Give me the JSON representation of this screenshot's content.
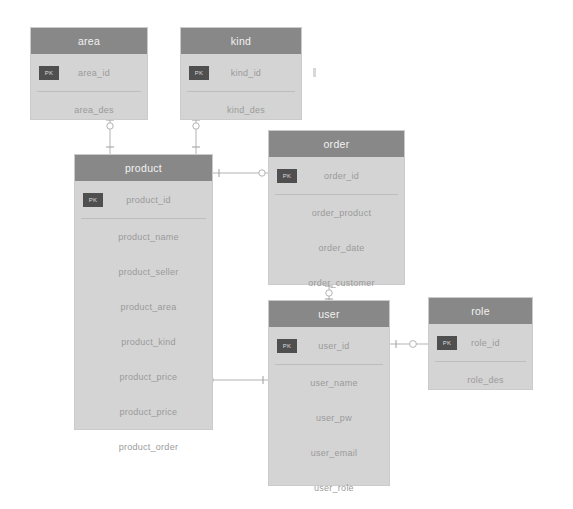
{
  "diagram": {
    "colors": {
      "background": "#ffffff",
      "entity_header": "#888888",
      "entity_body": "#d4d4d4",
      "pk_badge": "#4f4f4f",
      "attribute_text": "#9a9a9a",
      "edge": "#b3b3b3"
    },
    "pk_label": "PK"
  },
  "entities": [
    {
      "id": "area",
      "name": "area",
      "x": 30,
      "y": 27,
      "width": 118,
      "height": 93,
      "attributes": [
        {
          "name": "area_id",
          "key": "PK"
        },
        {
          "name": "area_des",
          "key": ""
        }
      ]
    },
    {
      "id": "kind",
      "name": "kind",
      "x": 180,
      "y": 27,
      "width": 122,
      "height": 93,
      "attributes": [
        {
          "name": "kind_id",
          "key": "PK"
        },
        {
          "name": "kind_des",
          "key": ""
        }
      ]
    },
    {
      "id": "product",
      "name": "product",
      "x": 74,
      "y": 154,
      "width": 139,
      "height": 276,
      "attributes": [
        {
          "name": "product_id",
          "key": "PK"
        },
        {
          "name": "product_name",
          "key": ""
        },
        {
          "name": "product_seller",
          "key": ""
        },
        {
          "name": "product_area",
          "key": ""
        },
        {
          "name": "product_kind",
          "key": ""
        },
        {
          "name": "product_price",
          "key": ""
        },
        {
          "name": "product_price",
          "key": ""
        },
        {
          "name": "product_order",
          "key": ""
        }
      ]
    },
    {
      "id": "order",
      "name": "order",
      "x": 268,
      "y": 130,
      "width": 137,
      "height": 155,
      "attributes": [
        {
          "name": "order_id",
          "key": "PK"
        },
        {
          "name": "order_product",
          "key": ""
        },
        {
          "name": "order_date",
          "key": ""
        },
        {
          "name": "order_customer",
          "key": ""
        }
      ]
    },
    {
      "id": "user",
      "name": "user",
      "x": 268,
      "y": 300,
      "width": 122,
      "height": 186,
      "attributes": [
        {
          "name": "user_id",
          "key": "PK"
        },
        {
          "name": "user_name",
          "key": ""
        },
        {
          "name": "user_pw",
          "key": ""
        },
        {
          "name": "user_email",
          "key": ""
        },
        {
          "name": "user_role",
          "key": ""
        }
      ]
    },
    {
      "id": "role",
      "name": "role",
      "x": 428,
      "y": 297,
      "width": 105,
      "height": 93,
      "attributes": [
        {
          "name": "role_id",
          "key": "PK"
        },
        {
          "name": "role_des",
          "key": ""
        }
      ]
    }
  ],
  "relationships": [
    {
      "from": "area",
      "to": "product",
      "from_attr": "area_id",
      "to_attr": "product_area"
    },
    {
      "from": "kind",
      "to": "product",
      "from_attr": "kind_id",
      "to_attr": "product_kind"
    },
    {
      "from": "product",
      "to": "order",
      "from_attr": "product_id",
      "to_attr": "order_id"
    },
    {
      "from": "order",
      "to": "user",
      "from_attr": "order_customer",
      "to_attr": "user_id"
    },
    {
      "from": "user",
      "to": "role",
      "from_attr": "user_role",
      "to_attr": "role_id"
    },
    {
      "from": "product",
      "to": "user",
      "from_attr": "product_price",
      "to_attr": "user_id"
    }
  ]
}
